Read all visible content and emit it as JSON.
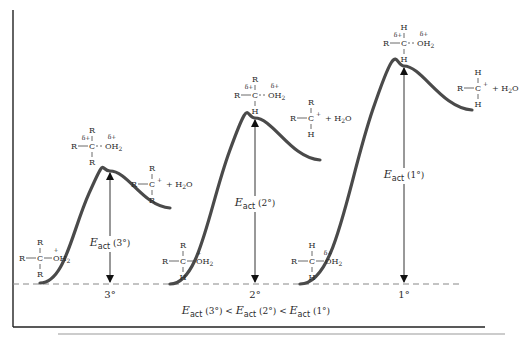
{
  "diagram": {
    "type": "energy-profile",
    "title": "",
    "baseline_y": 284,
    "frame": {
      "left_x": 13,
      "top_y": 10,
      "bottom_y": 327,
      "right_x": 485
    },
    "separator_line": {
      "x1": 58,
      "x2": 505,
      "y": 334
    },
    "summary": {
      "parts": [
        "E",
        "act",
        " (3°) < ",
        "E",
        "act",
        " (2°) < ",
        "E",
        "act",
        " (1°)"
      ],
      "text": "Eact (3°) < Eact (2°) < Eact (1°)"
    },
    "profiles": [
      {
        "id": "tertiary",
        "label": "3°",
        "eact_label": {
          "E": "E",
          "sub": "act",
          "paren": "(3°)"
        },
        "curve": {
          "start": [
            40,
            283
          ],
          "peak": [
            110,
            171
          ],
          "end": [
            170,
            208
          ]
        },
        "reactant": {
          "top": "R",
          "left": "R",
          "center": "C",
          "right": "OH",
          "right_sub": "2",
          "bottom": "R",
          "charge": "+"
        },
        "transition_state": {
          "top": "R",
          "left": "R",
          "center": "C",
          "right": "OH",
          "right_sub": "2",
          "bottom": "R",
          "delta_left": "δ+",
          "delta_right": "δ+"
        },
        "product": {
          "top": "R",
          "left": "R",
          "center": "C",
          "charge": "+",
          "bottom": "R",
          "plus": "+ H",
          "plus_sub": "2",
          "plus_end": "O"
        }
      },
      {
        "id": "secondary",
        "label": "2°",
        "eact_label": {
          "E": "E",
          "sub": "act",
          "paren": "(2°)"
        },
        "curve": {
          "start": [
            170,
            284
          ],
          "peak": [
            255,
            118
          ],
          "end": [
            320,
            160
          ]
        },
        "reactant": {
          "top": "R",
          "left": "R",
          "center": "C",
          "right": "OH",
          "right_sub": "2",
          "bottom": "H",
          "charge": "+"
        },
        "transition_state": {
          "top": "R",
          "left": "R",
          "center": "C",
          "right": "OH",
          "right_sub": "2",
          "bottom": "H",
          "delta_left": "δ+",
          "delta_right": "δ+"
        },
        "product": {
          "top": "R",
          "left": "R",
          "center": "C",
          "charge": "+",
          "bottom": "H",
          "plus": "+ H",
          "plus_sub": "2",
          "plus_end": "O"
        }
      },
      {
        "id": "primary",
        "label": "1°",
        "eact_label": {
          "E": "E",
          "sub": "act",
          "paren": "(1°)"
        },
        "curve": {
          "start": [
            300,
            284
          ],
          "peak": [
            404,
            66
          ],
          "end": [
            472,
            110
          ]
        },
        "reactant": {
          "top": "H",
          "left": "R",
          "center": "C",
          "right": "OH",
          "right_sub": "2",
          "bottom": "H",
          "charge": "δ+"
        },
        "transition_state": {
          "top": "H",
          "left": "R",
          "center": "C",
          "right": "OH",
          "right_sub": "2",
          "bottom": "H",
          "delta_left": "δ+",
          "delta_right": "δ+"
        },
        "product": {
          "top": "H",
          "left": "R",
          "center": "C",
          "charge": "+",
          "bottom": "H",
          "plus": "+ H",
          "plus_sub": "2",
          "plus_end": "O"
        }
      }
    ]
  }
}
